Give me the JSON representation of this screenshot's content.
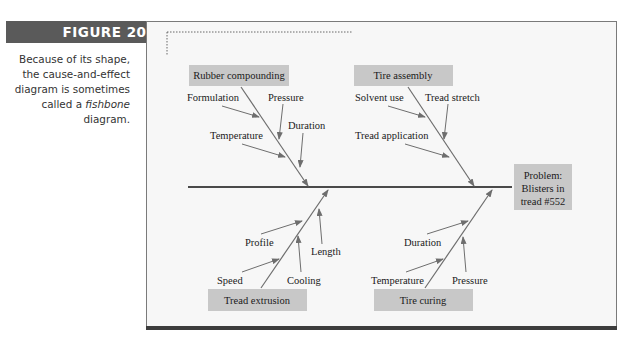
{
  "figure": {
    "label": "FIGURE 20.4",
    "caption_text": "Because of its shape, the cause-and-effect diagram is sometimes called a",
    "caption_italic": "fishbone",
    "caption_end": "diagram."
  },
  "diagram": {
    "type": "cause-and-effect (fishbone)",
    "problem": {
      "line1": "Problem:",
      "line2": "Blisters in",
      "line3": "tread #552"
    },
    "categories": [
      {
        "name": "Rubber compounding",
        "position": "top-left",
        "causes": [
          "Formulation",
          "Pressure",
          "Temperature",
          "Duration"
        ]
      },
      {
        "name": "Tire assembly",
        "position": "top-right",
        "causes": [
          "Solvent use",
          "Tread stretch",
          "Tread application"
        ]
      },
      {
        "name": "Tread extrusion",
        "position": "bottom-left",
        "causes": [
          "Profile",
          "Length",
          "Speed",
          "Cooling"
        ]
      },
      {
        "name": "Tire curing",
        "position": "bottom-right",
        "causes": [
          "Duration",
          "Temperature",
          "Pressure"
        ]
      }
    ]
  },
  "colors": {
    "figure_label_bg": "#5a5a5a",
    "panel_bg": "#f7f7f7",
    "box_fill": "#c8c8c8",
    "arrow": "#6e6e6e",
    "spine": "#111111"
  }
}
